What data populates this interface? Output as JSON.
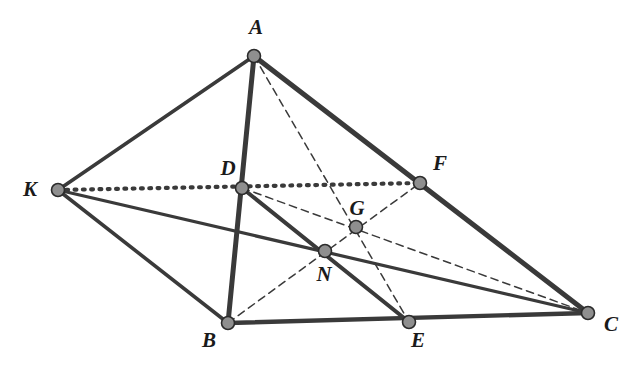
{
  "figure": {
    "kind": "geometry-diagram",
    "caption": "",
    "width": 636,
    "height": 377,
    "background_color": "#ffffff",
    "stroke_color": "#3a3a3a",
    "node_fill_color": "#8f8f8f",
    "node_stroke_color": "#2b2b2b",
    "label_color": "#1a1a1a"
  },
  "points": [
    {
      "id": "A",
      "label": "A",
      "x": 254,
      "y": 56,
      "label_x": 256,
      "label_y": 34
    },
    {
      "id": "K",
      "label": "K",
      "x": 58,
      "y": 190,
      "label_x": 30,
      "label_y": 196
    },
    {
      "id": "D",
      "label": "D",
      "x": 242,
      "y": 188,
      "label_x": 228,
      "label_y": 175
    },
    {
      "id": "F",
      "label": "F",
      "x": 420,
      "y": 183,
      "label_x": 440,
      "label_y": 170
    },
    {
      "id": "G",
      "label": "G",
      "x": 356,
      "y": 227,
      "label_x": 357,
      "label_y": 215
    },
    {
      "id": "N",
      "label": "N",
      "x": 325,
      "y": 251,
      "label_x": 324,
      "label_y": 281
    },
    {
      "id": "B",
      "label": "B",
      "x": 228,
      "y": 323,
      "label_x": 209,
      "label_y": 347
    },
    {
      "id": "E",
      "label": "E",
      "x": 409,
      "y": 322,
      "label_x": 418,
      "label_y": 347
    },
    {
      "id": "C",
      "label": "C",
      "x": 588,
      "y": 313,
      "label_x": 611,
      "label_y": 331
    }
  ],
  "edges": [
    {
      "id": "A-K",
      "from": "A",
      "to": "K",
      "style": "solid",
      "weight": 3.6
    },
    {
      "id": "A-B",
      "from": "A",
      "to": "B",
      "style": "solid",
      "weight": 5.0
    },
    {
      "id": "A-C",
      "from": "A",
      "to": "C",
      "style": "solid",
      "weight": 5.0
    },
    {
      "id": "K-B",
      "from": "K",
      "to": "B",
      "style": "solid",
      "weight": 3.6
    },
    {
      "id": "K-C",
      "from": "K",
      "to": "C",
      "style": "solid",
      "weight": 3.2
    },
    {
      "id": "B-C",
      "from": "B",
      "to": "C",
      "style": "solid",
      "weight": 4.4
    },
    {
      "id": "D-E",
      "from": "D",
      "to": "E",
      "style": "solid",
      "weight": 4.0
    },
    {
      "id": "K-F",
      "from": "K",
      "to": "F",
      "style": "dotted",
      "weight": 4.2
    },
    {
      "id": "A-E",
      "from": "A",
      "to": "E",
      "style": "dashed",
      "weight": 1.5
    },
    {
      "id": "B-F",
      "from": "B",
      "to": "F",
      "style": "dashed",
      "weight": 1.5
    },
    {
      "id": "D-C",
      "from": "D",
      "to": "C",
      "style": "dashed",
      "weight": 1.5
    },
    {
      "id": "F-C-d",
      "from": "F",
      "to": "C",
      "style": "dashed",
      "weight": 1.5
    }
  ],
  "markers": {
    "node_radius": 6.5,
    "node_stroke_width": 1.6
  }
}
